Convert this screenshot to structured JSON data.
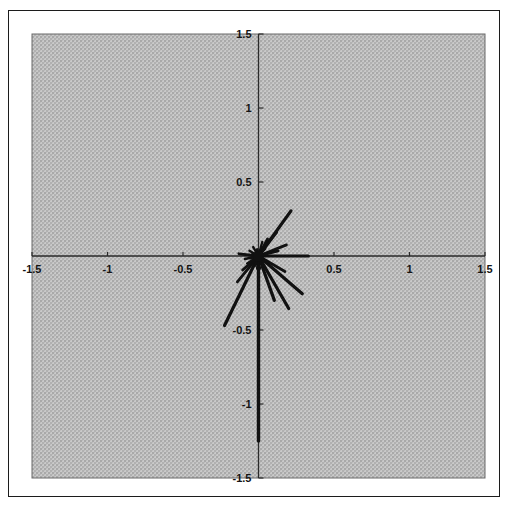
{
  "figure": {
    "title": "",
    "background_color": "#ffffff",
    "plot_background_color": "#bcbcbc",
    "frame_color": "#1c1c1c",
    "axis_color": "#2a2a2a",
    "data_color": "#111111"
  },
  "axes": {
    "x_tick_labels": [
      "-1.5",
      "-1",
      "-0.5",
      "0.5",
      "1",
      "1.5"
    ],
    "y_tick_labels": [
      "1.5",
      "1",
      "0.5",
      "-0.5",
      "-1",
      "-1.5"
    ],
    "x_label": "",
    "y_label": ""
  },
  "chart_data": {
    "type": "scatter",
    "subtype": "compass-vector-plot",
    "title": "",
    "xlabel": "",
    "ylabel": "",
    "xlim": [
      -1.5,
      1.5
    ],
    "ylim": [
      -1.5,
      1.5
    ],
    "xticks": [
      -1.5,
      -1,
      -0.5,
      0,
      0.5,
      1,
      1.5
    ],
    "yticks": [
      -1.5,
      -1,
      -0.5,
      0,
      0.5,
      1,
      1.5
    ],
    "xticklabels": [
      "-1.5",
      "-1",
      "-0.5",
      "",
      "0.5",
      "1",
      "1.5"
    ],
    "yticklabels": [
      "-1.5",
      "-1",
      "-0.5",
      "",
      "0.5",
      "1",
      "1.5"
    ],
    "grid": false,
    "legend": null,
    "origin": [
      0.0,
      0.0
    ],
    "note": "Rays (vectors) all originate at the origin (0,0); each entry gives the tip coordinate, plus its polar magnitude and angle in degrees.",
    "vectors": [
      {
        "x": 0.0,
        "y": -1.25,
        "r": 1.25,
        "theta_deg": -90.0
      },
      {
        "x": 0.215,
        "y": 0.305,
        "r": 0.373,
        "theta_deg": 54.8
      },
      {
        "x": 0.29,
        "y": -0.255,
        "r": 0.386,
        "theta_deg": -41.3
      },
      {
        "x": -0.225,
        "y": -0.47,
        "r": 0.521,
        "theta_deg": -115.6
      },
      {
        "x": 0.33,
        "y": 0.0,
        "r": 0.33,
        "theta_deg": 0.0
      },
      {
        "x": 0.2,
        "y": -0.355,
        "r": 0.407,
        "theta_deg": -60.6
      },
      {
        "x": 0.185,
        "y": 0.075,
        "r": 0.2,
        "theta_deg": 22.1
      },
      {
        "x": 0.175,
        "y": -0.105,
        "r": 0.204,
        "theta_deg": -31.0
      },
      {
        "x": 0.105,
        "y": -0.3,
        "r": 0.318,
        "theta_deg": -70.7
      },
      {
        "x": 0.12,
        "y": 0.16,
        "r": 0.2,
        "theta_deg": 53.1
      },
      {
        "x": -0.14,
        "y": -0.175,
        "r": 0.224,
        "theta_deg": -128.7
      },
      {
        "x": 0.13,
        "y": 0.035,
        "r": 0.135,
        "theta_deg": 15.1
      },
      {
        "x": -0.105,
        "y": -0.095,
        "r": 0.142,
        "theta_deg": -137.9
      },
      {
        "x": -0.13,
        "y": 0.015,
        "r": 0.131,
        "theta_deg": 173.4
      },
      {
        "x": 0.06,
        "y": 0.115,
        "r": 0.13,
        "theta_deg": 62.4
      },
      {
        "x": -0.075,
        "y": -0.05,
        "r": 0.09,
        "theta_deg": -146.3
      },
      {
        "x": -0.09,
        "y": -0.02,
        "r": 0.092,
        "theta_deg": -167.5
      },
      {
        "x": 0.025,
        "y": 0.095,
        "r": 0.098,
        "theta_deg": 75.3
      },
      {
        "x": -0.035,
        "y": 0.06,
        "r": 0.069,
        "theta_deg": 120.3
      },
      {
        "x": -0.06,
        "y": 0.035,
        "r": 0.069,
        "theta_deg": 149.7
      },
      {
        "x": -0.02,
        "y": -0.065,
        "r": 0.068,
        "theta_deg": -107.1
      },
      {
        "x": 0.06,
        "y": -0.04,
        "r": 0.072,
        "theta_deg": -33.7
      },
      {
        "x": 0.045,
        "y": 0.05,
        "r": 0.067,
        "theta_deg": 48.0
      },
      {
        "x": -0.055,
        "y": -0.015,
        "r": 0.057,
        "theta_deg": -164.7
      },
      {
        "x": 0.015,
        "y": -0.05,
        "r": 0.052,
        "theta_deg": -73.3
      },
      {
        "x": -0.01,
        "y": 0.045,
        "r": 0.046,
        "theta_deg": 102.5
      },
      {
        "x": 0.05,
        "y": 0.01,
        "r": 0.051,
        "theta_deg": 11.3
      },
      {
        "x": -0.04,
        "y": 0.018,
        "r": 0.044,
        "theta_deg": 155.8
      },
      {
        "x": 0.03,
        "y": -0.025,
        "r": 0.039,
        "theta_deg": -39.8
      },
      {
        "x": -0.028,
        "y": -0.03,
        "r": 0.041,
        "theta_deg": -133.0
      }
    ],
    "markers": [
      {
        "x": 0.0,
        "y": -0.08,
        "kind": "dot"
      }
    ]
  }
}
